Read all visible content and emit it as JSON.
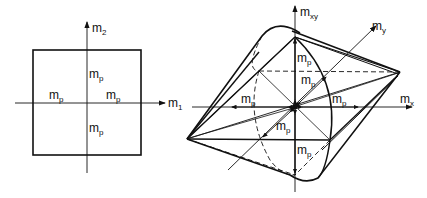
{
  "left_diagram": {
    "title": "square yield criterion",
    "axis_horizontal": {
      "main": "m",
      "sub": "1"
    },
    "axis_vertical": {
      "main": "m",
      "sub": "2"
    },
    "labels": {
      "top": {
        "main": "m",
        "sub": "p"
      },
      "left": {
        "main": "m",
        "sub": "p"
      },
      "right": {
        "main": "m",
        "sub": "p"
      },
      "bottom": {
        "main": "m",
        "sub": "p"
      }
    }
  },
  "right_diagram": {
    "title": "yield surface in m_x, m_y, m_xy space",
    "axis_x": {
      "main": "m",
      "sub": "x"
    },
    "axis_y": {
      "main": "m",
      "sub": "y"
    },
    "axis_xy": {
      "main": "m",
      "sub": "xy"
    },
    "labels": {
      "upper": {
        "main": "m",
        "sub": "p"
      },
      "upper_diag": {
        "main": "m",
        "sub": "p"
      },
      "left": {
        "main": "m",
        "sub": "p"
      },
      "right": {
        "main": "m",
        "sub": "p"
      },
      "lower_diag": {
        "main": "m",
        "sub": "p"
      },
      "lower": {
        "main": "m",
        "sub": "p"
      }
    }
  },
  "colors": {
    "ink": "#111111",
    "background": "#ffffff"
  }
}
